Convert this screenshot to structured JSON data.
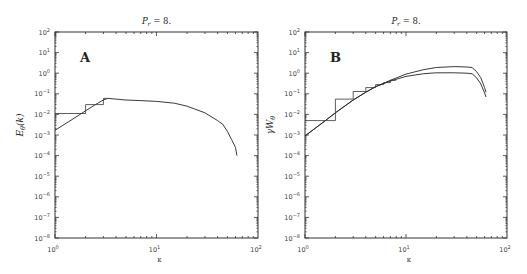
{
  "figure": {
    "panels": [
      {
        "id": "A",
        "title": "P_r = 8.",
        "title_main": "P",
        "title_sub": "r",
        "title_rest": " = 8.",
        "letter": "A",
        "ylabel": "E_θ(k)",
        "ylabel_main": "E",
        "ylabel_sub": "θ",
        "ylabel_rest": "(k)",
        "xlabel": "κ"
      },
      {
        "id": "B",
        "title": "P_r = 8.",
        "title_main": "P",
        "title_sub": "r",
        "title_rest": " = 8.",
        "letter": "B",
        "ylabel": "γW_θ",
        "ylabel_main": "γW",
        "ylabel_sub": "θ",
        "ylabel_rest": "",
        "xlabel": "κ"
      }
    ],
    "x_tick_labels": [
      "10",
      "10",
      "10"
    ],
    "x_tick_exps": [
      "0",
      "1",
      "2"
    ],
    "y_tick_exps": [
      "2",
      "1",
      "0",
      "-1",
      "-2",
      "-3",
      "-4",
      "-5",
      "-6",
      "-7",
      "-8"
    ]
  },
  "chart_data": [
    {
      "type": "line",
      "panel": "A",
      "title": "P_r = 8.",
      "xlabel": "κ",
      "ylabel": "E_θ(k)",
      "xscale": "log",
      "yscale": "log",
      "xlim": [
        1,
        100
      ],
      "ylim": [
        1e-08,
        100
      ],
      "x_ticks": [
        "10^0",
        "10^1",
        "10^2"
      ],
      "y_ticks": [
        "10^2",
        "10^1",
        "10^0",
        "10^-1",
        "10^-2",
        "10^-3",
        "10^-4",
        "10^-5",
        "10^-6",
        "10^-7",
        "10^-8"
      ],
      "annotations": [
        "A"
      ],
      "series": [
        {
          "name": "smooth spectrum",
          "x": [
            1,
            1.5,
            2,
            2.5,
            3,
            3.3,
            4,
            5,
            7,
            10,
            15,
            20,
            30,
            40,
            45,
            50,
            55,
            60,
            62
          ],
          "y": [
            0.0017,
            0.006,
            0.015,
            0.03,
            0.05,
            0.06,
            0.055,
            0.05,
            0.047,
            0.043,
            0.035,
            0.025,
            0.012,
            0.005,
            0.0033,
            0.0015,
            0.0006,
            0.00025,
            0.0001
          ]
        },
        {
          "name": "shell-averaged (step)",
          "x": [
            1,
            2,
            2,
            3,
            3,
            3.3
          ],
          "y": [
            0.011,
            0.011,
            0.03,
            0.03,
            0.06,
            0.06
          ]
        }
      ]
    },
    {
      "type": "line",
      "panel": "B",
      "title": "P_r = 8.",
      "xlabel": "κ",
      "ylabel": "γW_θ",
      "xscale": "log",
      "yscale": "log",
      "xlim": [
        1,
        100
      ],
      "ylim": [
        1e-08,
        100
      ],
      "x_ticks": [
        "10^0",
        "10^1",
        "10^2"
      ],
      "y_ticks": [
        "10^2",
        "10^1",
        "10^0",
        "10^-1",
        "10^-2",
        "10^-3",
        "10^-4",
        "10^-5",
        "10^-6",
        "10^-7",
        "10^-8"
      ],
      "annotations": [
        "B"
      ],
      "series": [
        {
          "name": "upper curve",
          "x": [
            1,
            1.5,
            2,
            3,
            4,
            5,
            7,
            10,
            15,
            20,
            30,
            40,
            45,
            50,
            55,
            60,
            62
          ],
          "y": [
            0.0009,
            0.004,
            0.012,
            0.05,
            0.12,
            0.22,
            0.45,
            0.9,
            1.5,
            1.9,
            2.1,
            2.0,
            1.9,
            1.2,
            0.6,
            0.2,
            0.12
          ]
        },
        {
          "name": "lower curve",
          "x": [
            1,
            1.5,
            2,
            3,
            4,
            5,
            7,
            10,
            15,
            20,
            30,
            40,
            45,
            50,
            55,
            60,
            62
          ],
          "y": [
            0.0009,
            0.004,
            0.012,
            0.05,
            0.12,
            0.22,
            0.42,
            0.7,
            0.95,
            1.05,
            1.05,
            1.0,
            0.95,
            0.6,
            0.3,
            0.11,
            0.07
          ]
        },
        {
          "name": "shell-averaged (step)",
          "x": [
            1,
            2,
            2,
            3,
            3,
            4,
            4,
            5,
            5,
            6,
            6,
            7,
            7,
            8
          ],
          "y": [
            0.005,
            0.005,
            0.055,
            0.055,
            0.13,
            0.13,
            0.2,
            0.2,
            0.28,
            0.28,
            0.35,
            0.35,
            0.45,
            0.45
          ]
        }
      ]
    }
  ]
}
